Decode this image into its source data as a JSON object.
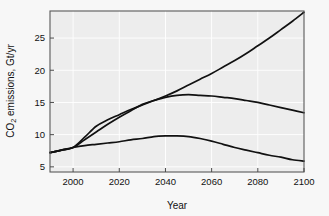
{
  "chart_data": {
    "type": "line",
    "title": "",
    "xlabel": "Year",
    "ylabel": "CO2 emissions, Gt/yr",
    "ylabel_parts": {
      "pre": "CO",
      "sub": "2",
      "post": " emissions, Gt/yr"
    },
    "xlim": [
      1990,
      2100
    ],
    "ylim": [
      4.2,
      29.2
    ],
    "xticks": [
      2000,
      2020,
      2040,
      2060,
      2080,
      2100
    ],
    "xtick_labels": [
      "2000",
      "2020",
      "2040",
      "2060",
      "2080",
      "2100"
    ],
    "yticks": [
      5,
      10,
      15,
      20,
      25
    ],
    "ytick_labels": [
      "5",
      "10",
      "15",
      "20",
      "25"
    ],
    "grid": true,
    "legend": "none",
    "line_color": "#111111",
    "plot_background": "#ededed",
    "page_background": "#f7f7f7",
    "series": [
      {
        "name": "high-growth-scenario",
        "x": [
          1990,
          1995,
          2000,
          2005,
          2010,
          2015,
          2020,
          2025,
          2030,
          2035,
          2040,
          2045,
          2050,
          2055,
          2060,
          2065,
          2070,
          2075,
          2080,
          2085,
          2090,
          2095,
          2100
        ],
        "values": [
          7.2,
          7.6,
          8.0,
          9.6,
          11.3,
          12.3,
          13.1,
          13.9,
          14.6,
          15.3,
          16.0,
          16.8,
          17.7,
          18.6,
          19.5,
          20.5,
          21.5,
          22.6,
          23.8,
          25.0,
          26.3,
          27.6,
          29.0
        ]
      },
      {
        "name": "mid-plateau-scenario",
        "x": [
          1990,
          1995,
          2000,
          2005,
          2010,
          2015,
          2020,
          2025,
          2030,
          2035,
          2040,
          2045,
          2050,
          2055,
          2060,
          2065,
          2070,
          2075,
          2080,
          2085,
          2090,
          2095,
          2100
        ],
        "values": [
          7.2,
          7.6,
          8.0,
          9.2,
          10.4,
          11.6,
          12.7,
          13.7,
          14.7,
          15.3,
          15.8,
          16.1,
          16.2,
          16.1,
          16.0,
          15.8,
          15.6,
          15.3,
          15.0,
          14.6,
          14.2,
          13.8,
          13.4
        ]
      },
      {
        "name": "low-peak-decline-scenario",
        "x": [
          1990,
          1995,
          2000,
          2005,
          2010,
          2015,
          2020,
          2025,
          2030,
          2035,
          2040,
          2045,
          2050,
          2055,
          2060,
          2065,
          2070,
          2075,
          2080,
          2085,
          2090,
          2095,
          2100
        ],
        "values": [
          7.2,
          7.6,
          8.0,
          8.3,
          8.5,
          8.7,
          8.9,
          9.2,
          9.4,
          9.7,
          9.8,
          9.8,
          9.7,
          9.4,
          9.0,
          8.5,
          8.0,
          7.6,
          7.2,
          6.8,
          6.5,
          6.1,
          5.9
        ]
      }
    ]
  }
}
